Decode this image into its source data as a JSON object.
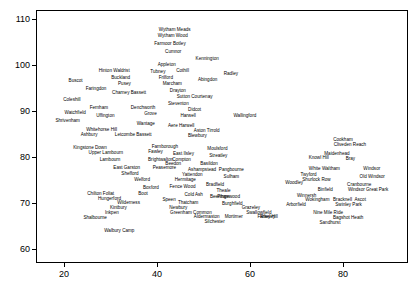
{
  "chart_data": {
    "type": "scatter",
    "title": "",
    "subtitle": "",
    "xlabel": "",
    "ylabel": "",
    "xlim": [
      14,
      94
    ],
    "ylim": [
      57,
      112
    ],
    "grid": false,
    "legend": "none",
    "xticks": [
      20,
      40,
      60,
      80
    ],
    "yticks": [
      60,
      70,
      80,
      90,
      100,
      110
    ],
    "marker": "text-label",
    "labels": [
      {
        "name": "Wytham Meads",
        "x": 43.6,
        "y": 108.0
      },
      {
        "name": "Wytham Wood",
        "x": 43.2,
        "y": 106.8
      },
      {
        "name": "Farmoor Botley",
        "x": 42.6,
        "y": 105.1
      },
      {
        "name": "Cumnor",
        "x": 43.3,
        "y": 103.4
      },
      {
        "name": "Kennington",
        "x": 50.6,
        "y": 101.7
      },
      {
        "name": "Appleton",
        "x": 41.9,
        "y": 100.5
      },
      {
        "name": "Hinton Waldrist",
        "x": 30.6,
        "y": 99.2
      },
      {
        "name": "Tubney",
        "x": 40.0,
        "y": 98.9
      },
      {
        "name": "Cothill",
        "x": 45.3,
        "y": 99.1
      },
      {
        "name": "Radley",
        "x": 55.7,
        "y": 98.6
      },
      {
        "name": "Buckland",
        "x": 32.0,
        "y": 97.7
      },
      {
        "name": "Frilford",
        "x": 41.7,
        "y": 97.6
      },
      {
        "name": "Abingdon",
        "x": 50.7,
        "y": 97.3
      },
      {
        "name": "Buscot",
        "x": 22.3,
        "y": 96.9
      },
      {
        "name": "Pusey",
        "x": 32.8,
        "y": 96.3
      },
      {
        "name": "Marcham",
        "x": 43.1,
        "y": 96.3
      },
      {
        "name": "Faringdon",
        "x": 26.7,
        "y": 95.2
      },
      {
        "name": "Drayton",
        "x": 44.3,
        "y": 94.8
      },
      {
        "name": "Charney Bassett",
        "x": 33.8,
        "y": 94.5
      },
      {
        "name": "Sutton Courtenay",
        "x": 47.9,
        "y": 93.5
      },
      {
        "name": "Coleshill",
        "x": 21.5,
        "y": 92.9
      },
      {
        "name": "Steventon",
        "x": 44.4,
        "y": 92.1
      },
      {
        "name": "Fernham",
        "x": 27.3,
        "y": 91.2
      },
      {
        "name": "Denchworth",
        "x": 36.8,
        "y": 91.1
      },
      {
        "name": "Didcot",
        "x": 47.9,
        "y": 90.8
      },
      {
        "name": "Watchfield",
        "x": 22.2,
        "y": 90.1
      },
      {
        "name": "Grove",
        "x": 38.4,
        "y": 89.9
      },
      {
        "name": "Uffington",
        "x": 28.7,
        "y": 89.5
      },
      {
        "name": "Harwell",
        "x": 46.5,
        "y": 89.5
      },
      {
        "name": "Wallingford",
        "x": 58.7,
        "y": 89.5
      },
      {
        "name": "Shrivenham",
        "x": 20.6,
        "y": 88.3
      },
      {
        "name": "Wantage",
        "x": 37.4,
        "y": 87.6
      },
      {
        "name": "Aere Harwell",
        "x": 45.0,
        "y": 87.3
      },
      {
        "name": "Whitehorse Hill",
        "x": 27.9,
        "y": 86.4
      },
      {
        "name": "Aston Tirrold",
        "x": 50.5,
        "y": 86.2
      },
      {
        "name": "Ashbury",
        "x": 25.2,
        "y": 85.2
      },
      {
        "name": "Letcombe Bassett",
        "x": 34.7,
        "y": 85.2
      },
      {
        "name": "Blewbury",
        "x": 48.5,
        "y": 85.0
      },
      {
        "name": "Cookham",
        "x": 79.8,
        "y": 84.2
      },
      {
        "name": "Cliveden Reach",
        "x": 81.3,
        "y": 83.1
      },
      {
        "name": "Kingstone Down",
        "x": 25.4,
        "y": 82.5
      },
      {
        "name": "Farnborough",
        "x": 41.5,
        "y": 82.6
      },
      {
        "name": "Moulsford",
        "x": 52.8,
        "y": 82.3
      },
      {
        "name": "Maidenhead",
        "x": 78.5,
        "y": 81.2
      },
      {
        "name": "Upper Lambourn",
        "x": 28.8,
        "y": 81.3
      },
      {
        "name": "Fawley",
        "x": 39.5,
        "y": 81.5
      },
      {
        "name": "East Ilsley",
        "x": 45.5,
        "y": 81.2
      },
      {
        "name": "Streatley",
        "x": 53.0,
        "y": 80.8
      },
      {
        "name": "Knowl Hill",
        "x": 74.6,
        "y": 80.2
      },
      {
        "name": "Bray",
        "x": 81.4,
        "y": 80.1
      },
      {
        "name": "Lambourn",
        "x": 29.7,
        "y": 79.8
      },
      {
        "name": "Brightwalton",
        "x": 40.6,
        "y": 79.8
      },
      {
        "name": "Compton",
        "x": 45.1,
        "y": 79.8
      },
      {
        "name": "Beedon",
        "x": 43.3,
        "y": 78.9
      },
      {
        "name": "Basildon",
        "x": 51.0,
        "y": 78.9
      },
      {
        "name": "East Garston",
        "x": 33.3,
        "y": 78.0
      },
      {
        "name": "Peasemore",
        "x": 41.4,
        "y": 78.0
      },
      {
        "name": "Ashampstead",
        "x": 49.5,
        "y": 77.6
      },
      {
        "name": "Pangbourne",
        "x": 55.8,
        "y": 77.6
      },
      {
        "name": "White Waltham",
        "x": 75.8,
        "y": 77.8
      },
      {
        "name": "Windsor",
        "x": 86.0,
        "y": 77.8
      },
      {
        "name": "Shefford",
        "x": 34.0,
        "y": 76.8
      },
      {
        "name": "Yattendon",
        "x": 47.4,
        "y": 76.5
      },
      {
        "name": "Twyford",
        "x": 72.4,
        "y": 76.5
      },
      {
        "name": "Sulham",
        "x": 55.8,
        "y": 76.2
      },
      {
        "name": "Old Windsor",
        "x": 86.1,
        "y": 76.1
      },
      {
        "name": "Welford",
        "x": 36.6,
        "y": 75.5
      },
      {
        "name": "Hermitage",
        "x": 45.9,
        "y": 75.4
      },
      {
        "name": "Shurlock Row",
        "x": 74.1,
        "y": 75.5
      },
      {
        "name": "Woodley",
        "x": 69.3,
        "y": 74.9
      },
      {
        "name": "Cranbourne",
        "x": 83.3,
        "y": 74.5
      },
      {
        "name": "Bradfield",
        "x": 52.3,
        "y": 74.4
      },
      {
        "name": "Boxford",
        "x": 38.5,
        "y": 73.8
      },
      {
        "name": "Fence Wood",
        "x": 45.3,
        "y": 73.9
      },
      {
        "name": "Binfield",
        "x": 76.0,
        "y": 73.3
      },
      {
        "name": "Theale",
        "x": 54.1,
        "y": 73.0
      },
      {
        "name": "Windsor Great Park",
        "x": 85.2,
        "y": 73.2
      },
      {
        "name": "Chilton Foliat",
        "x": 27.7,
        "y": 72.5
      },
      {
        "name": "Boot",
        "x": 36.8,
        "y": 72.4
      },
      {
        "name": "Cold Ash",
        "x": 47.7,
        "y": 72.3
      },
      {
        "name": "Beenham",
        "x": 53.3,
        "y": 71.8
      },
      {
        "name": "Winnersh",
        "x": 72.0,
        "y": 72.0
      },
      {
        "name": "Pingewood",
        "x": 55.2,
        "y": 71.7
      },
      {
        "name": "Hungerford",
        "x": 29.6,
        "y": 71.3
      },
      {
        "name": "Speen",
        "x": 42.4,
        "y": 71.2
      },
      {
        "name": "Wokingham",
        "x": 74.3,
        "y": 71.1
      },
      {
        "name": "Bracknell",
        "x": 79.7,
        "y": 71.1
      },
      {
        "name": "Ascot",
        "x": 83.5,
        "y": 71.1
      },
      {
        "name": "Wilderness",
        "x": 33.7,
        "y": 70.4
      },
      {
        "name": "Thatcham",
        "x": 46.5,
        "y": 70.5
      },
      {
        "name": "Burghfield",
        "x": 56.0,
        "y": 70.2
      },
      {
        "name": "Arborfield",
        "x": 69.7,
        "y": 70.0
      },
      {
        "name": "Swinley Park",
        "x": 81.0,
        "y": 70.0
      },
      {
        "name": "Kintbury",
        "x": 31.5,
        "y": 69.4
      },
      {
        "name": "Newbury",
        "x": 44.4,
        "y": 69.5
      },
      {
        "name": "Grazeley",
        "x": 60.0,
        "y": 69.5
      },
      {
        "name": "Riseley",
        "x": 63.6,
        "y": 67.5
      },
      {
        "name": "Inkpen",
        "x": 30.1,
        "y": 68.3
      },
      {
        "name": "Greenham Common",
        "x": 47.1,
        "y": 68.3
      },
      {
        "name": "Swallowfield",
        "x": 61.7,
        "y": 68.4
      },
      {
        "name": "Nine Mile Ride",
        "x": 76.6,
        "y": 68.4
      },
      {
        "name": "Shalbourne",
        "x": 26.5,
        "y": 67.3
      },
      {
        "name": "Mortimer",
        "x": 56.3,
        "y": 67.4
      },
      {
        "name": "Farley Hill",
        "x": 63.6,
        "y": 67.4
      },
      {
        "name": "Bagshot Heath",
        "x": 80.9,
        "y": 67.2
      },
      {
        "name": "Aldermaston",
        "x": 50.5,
        "y": 67.4
      },
      {
        "name": "Silchester",
        "x": 52.2,
        "y": 66.3
      },
      {
        "name": "Sandhurst",
        "x": 77.0,
        "y": 66.1
      },
      {
        "name": "Walbury Camp",
        "x": 31.7,
        "y": 64.5
      }
    ]
  }
}
